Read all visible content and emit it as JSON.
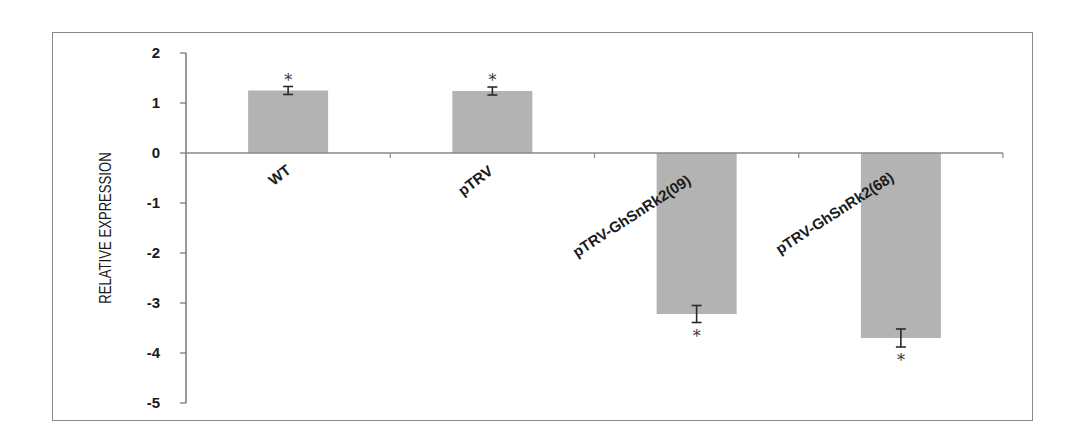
{
  "chart_data": {
    "type": "bar",
    "title": "",
    "xlabel": "",
    "ylabel": "RELATIVE EXPRESSION",
    "ylim": [
      -5,
      2
    ],
    "yticks": [
      2,
      1,
      0,
      -1,
      -2,
      -3,
      -4,
      -5
    ],
    "grid": false,
    "legend": null,
    "categories": [
      "WT",
      "pTRV",
      "pTRV-GhSnRk2(09)",
      "pTRV-GhSnRk2(68)"
    ],
    "values": [
      1.25,
      1.24,
      -3.22,
      -3.7
    ],
    "error": [
      0.08,
      0.08,
      0.17,
      0.18
    ],
    "annotations": [
      "*",
      "*",
      "*",
      "*"
    ],
    "bar_color": "#b3b3b3"
  }
}
